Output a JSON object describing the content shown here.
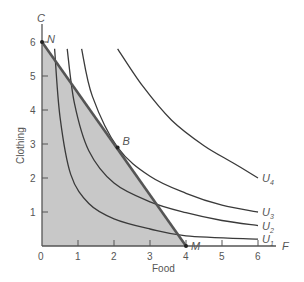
{
  "chart_data": {
    "type": "line",
    "title": "",
    "xlabel": "Food",
    "ylabel": "Clothing",
    "xlim": [
      0,
      6.5
    ],
    "ylim": [
      0,
      6.6
    ],
    "x_ticks": [
      "0",
      "1",
      "2",
      "3",
      "4",
      "5",
      "6"
    ],
    "y_ticks": [
      "1",
      "2",
      "3",
      "4",
      "5",
      "6"
    ],
    "grid": false,
    "axis_end_labels": {
      "x": "F",
      "y": "C"
    },
    "budget_line": {
      "name": "Budget line NM",
      "points": [
        [
          0,
          6
        ],
        [
          4,
          0
        ]
      ],
      "shaded_region": "feasible set below budget line",
      "fill_color": "#c8c8c8",
      "line_color": "#555555"
    },
    "points": [
      {
        "name": "N",
        "x": 0,
        "y": 6
      },
      {
        "name": "M",
        "x": 4,
        "y": 0
      },
      {
        "name": "B",
        "x": 2.1,
        "y": 2.9
      }
    ],
    "series": [
      {
        "name": "U1",
        "label": "U",
        "sub": "1",
        "values": [
          [
            0.35,
            5.8
          ],
          [
            0.5,
            3.8
          ],
          [
            0.8,
            2.1
          ],
          [
            1.3,
            1.25
          ],
          [
            2,
            0.8
          ],
          [
            3,
            0.5
          ],
          [
            4,
            0.3
          ],
          [
            6,
            0.2
          ]
        ]
      },
      {
        "name": "U2",
        "label": "U",
        "sub": "2",
        "values": [
          [
            0.7,
            5.8
          ],
          [
            0.9,
            4.2
          ],
          [
            1.3,
            2.8
          ],
          [
            2,
            1.85
          ],
          [
            3,
            1.3
          ],
          [
            4,
            0.98
          ],
          [
            5,
            0.75
          ],
          [
            6,
            0.6
          ]
        ]
      },
      {
        "name": "U3",
        "label": "U",
        "sub": "3",
        "values": [
          [
            1.1,
            5.8
          ],
          [
            1.4,
            4.4
          ],
          [
            2.1,
            2.9
          ],
          [
            3,
            2.05
          ],
          [
            4,
            1.55
          ],
          [
            5,
            1.2
          ],
          [
            6,
            1.0
          ]
        ]
      },
      {
        "name": "U4",
        "label": "U",
        "sub": "4",
        "values": [
          [
            2.1,
            5.8
          ],
          [
            2.8,
            4.7
          ],
          [
            3.6,
            3.7
          ],
          [
            4.5,
            2.95
          ],
          [
            5.3,
            2.45
          ],
          [
            6,
            2.0
          ]
        ]
      }
    ]
  }
}
